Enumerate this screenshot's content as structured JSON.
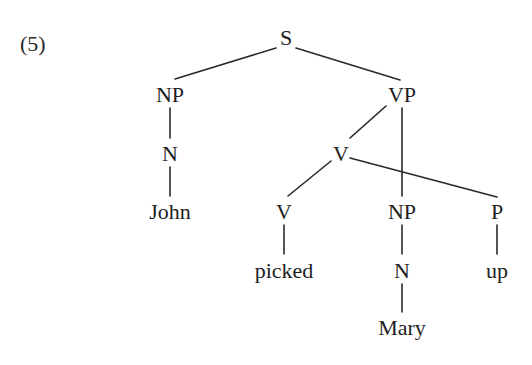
{
  "example_number": "(5)",
  "tree": {
    "type": "syntax-tree",
    "nodes": [
      {
        "id": "S",
        "label": "S"
      },
      {
        "id": "NP1",
        "label": "NP"
      },
      {
        "id": "VP",
        "label": "VP"
      },
      {
        "id": "N1",
        "label": "N"
      },
      {
        "id": "John",
        "label": "John"
      },
      {
        "id": "V1",
        "label": "V"
      },
      {
        "id": "V2",
        "label": "V"
      },
      {
        "id": "NP2",
        "label": "NP"
      },
      {
        "id": "P",
        "label": "P"
      },
      {
        "id": "picked",
        "label": "picked"
      },
      {
        "id": "N2",
        "label": "N"
      },
      {
        "id": "up",
        "label": "up"
      },
      {
        "id": "Mary",
        "label": "Mary"
      }
    ],
    "edges": [
      {
        "from": "S",
        "to": "NP1"
      },
      {
        "from": "S",
        "to": "VP"
      },
      {
        "from": "NP1",
        "to": "N1"
      },
      {
        "from": "N1",
        "to": "John"
      },
      {
        "from": "VP",
        "to": "V1"
      },
      {
        "from": "VP",
        "to": "NP2"
      },
      {
        "from": "V1",
        "to": "V2"
      },
      {
        "from": "V1",
        "to": "P"
      },
      {
        "from": "V2",
        "to": "picked"
      },
      {
        "from": "NP2",
        "to": "N2"
      },
      {
        "from": "N2",
        "to": "Mary"
      },
      {
        "from": "P",
        "to": "up"
      }
    ]
  }
}
